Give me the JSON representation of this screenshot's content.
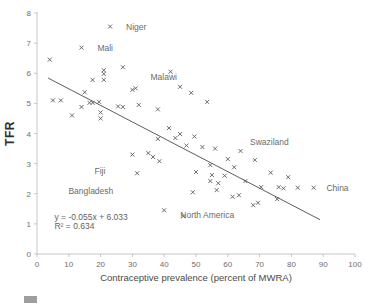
{
  "chart_data": {
    "type": "scatter",
    "title": "",
    "xlabel": "Contraceptive prevalence (percent of MWRA)",
    "ylabel": "TFR",
    "xlim": [
      0,
      100
    ],
    "ylim": [
      0,
      8
    ],
    "xticks": [
      0,
      10,
      20,
      30,
      40,
      50,
      60,
      70,
      80,
      90,
      100
    ],
    "yticks": [
      0,
      1,
      2,
      3,
      4,
      5,
      6,
      7,
      8
    ],
    "grid": false,
    "legend": "none",
    "trendline": {
      "equation": "y = -0.055x + 6.033",
      "r2_text": "R² = 0.634",
      "slope": -0.055,
      "intercept": 6.033,
      "r2": 0.634,
      "x_start": 3.5,
      "x_end": 89.0
    },
    "annotations": [
      {
        "label": "Niger",
        "x": 23.0,
        "y": 7.55,
        "dx": 5,
        "dy": 0
      },
      {
        "label": "Mali",
        "x": 14.0,
        "y": 6.85,
        "dx": 5,
        "dy": 0
      },
      {
        "label": "Malawi",
        "x": 45.0,
        "y": 5.55,
        "dx": -1,
        "dy": 0.32
      },
      {
        "label": "Swaziland",
        "x": 64.0,
        "y": 3.42,
        "dx": 3,
        "dy": 0.3
      },
      {
        "label": "Fiji",
        "x": 31.5,
        "y": 2.68,
        "dx": -10,
        "dy": 0.07
      },
      {
        "label": "Bangladesh",
        "x": 49.0,
        "y": 2.05,
        "dx": -25,
        "dy": 0.05
      },
      {
        "label": "North America",
        "x": 72.0,
        "y": 1.55,
        "dx": -10,
        "dy": -0.25
      },
      {
        "label": "China",
        "x": 87.0,
        "y": 2.2,
        "dx": 4,
        "dy": 0
      }
    ],
    "points": [
      {
        "x": 4.0,
        "y": 6.45
      },
      {
        "x": 14.0,
        "y": 6.85
      },
      {
        "x": 23.0,
        "y": 7.55
      },
      {
        "x": 21.0,
        "y": 6.1
      },
      {
        "x": 21.0,
        "y": 5.98
      },
      {
        "x": 27.0,
        "y": 6.2
      },
      {
        "x": 42.0,
        "y": 6.05
      },
      {
        "x": 17.5,
        "y": 5.78
      },
      {
        "x": 21.0,
        "y": 5.78
      },
      {
        "x": 45.0,
        "y": 5.55
      },
      {
        "x": 48.5,
        "y": 5.35
      },
      {
        "x": 30.0,
        "y": 5.45
      },
      {
        "x": 31.0,
        "y": 5.5
      },
      {
        "x": 15.0,
        "y": 5.37
      },
      {
        "x": 5.0,
        "y": 5.1
      },
      {
        "x": 7.5,
        "y": 5.1
      },
      {
        "x": 16.5,
        "y": 5.02
      },
      {
        "x": 17.5,
        "y": 5.02
      },
      {
        "x": 19.5,
        "y": 5.05
      },
      {
        "x": 25.5,
        "y": 4.9
      },
      {
        "x": 27.0,
        "y": 4.88
      },
      {
        "x": 32.0,
        "y": 4.95
      },
      {
        "x": 53.5,
        "y": 5.05
      },
      {
        "x": 38.0,
        "y": 4.8
      },
      {
        "x": 14.0,
        "y": 4.88
      },
      {
        "x": 11.0,
        "y": 4.6
      },
      {
        "x": 20.0,
        "y": 4.7
      },
      {
        "x": 20.0,
        "y": 4.5
      },
      {
        "x": 41.5,
        "y": 4.18
      },
      {
        "x": 45.0,
        "y": 3.98
      },
      {
        "x": 38.0,
        "y": 3.82
      },
      {
        "x": 43.5,
        "y": 3.85
      },
      {
        "x": 49.5,
        "y": 3.9
      },
      {
        "x": 47.0,
        "y": 3.6
      },
      {
        "x": 52.0,
        "y": 3.55
      },
      {
        "x": 56.0,
        "y": 3.5
      },
      {
        "x": 64.0,
        "y": 3.42
      },
      {
        "x": 35.0,
        "y": 3.35
      },
      {
        "x": 30.0,
        "y": 3.3
      },
      {
        "x": 36.5,
        "y": 3.22
      },
      {
        "x": 38.5,
        "y": 3.08
      },
      {
        "x": 60.0,
        "y": 3.15
      },
      {
        "x": 68.5,
        "y": 3.12
      },
      {
        "x": 54.5,
        "y": 2.95
      },
      {
        "x": 62.0,
        "y": 2.88
      },
      {
        "x": 31.5,
        "y": 2.68
      },
      {
        "x": 50.0,
        "y": 2.72
      },
      {
        "x": 55.0,
        "y": 2.62
      },
      {
        "x": 59.0,
        "y": 2.6
      },
      {
        "x": 73.5,
        "y": 2.7
      },
      {
        "x": 79.0,
        "y": 2.55
      },
      {
        "x": 49.0,
        "y": 2.05
      },
      {
        "x": 54.5,
        "y": 2.42
      },
      {
        "x": 57.0,
        "y": 2.35
      },
      {
        "x": 65.5,
        "y": 2.42
      },
      {
        "x": 70.5,
        "y": 2.22
      },
      {
        "x": 76.0,
        "y": 2.22
      },
      {
        "x": 77.5,
        "y": 2.18
      },
      {
        "x": 82.0,
        "y": 2.2
      },
      {
        "x": 87.0,
        "y": 2.2
      },
      {
        "x": 56.5,
        "y": 2.12
      },
      {
        "x": 40.0,
        "y": 1.45
      },
      {
        "x": 46.0,
        "y": 1.25
      },
      {
        "x": 61.5,
        "y": 1.9
      },
      {
        "x": 63.5,
        "y": 1.95
      },
      {
        "x": 75.5,
        "y": 1.82
      },
      {
        "x": 68.0,
        "y": 1.62
      },
      {
        "x": 69.5,
        "y": 1.7
      }
    ]
  },
  "caption": {
    "text": ""
  }
}
